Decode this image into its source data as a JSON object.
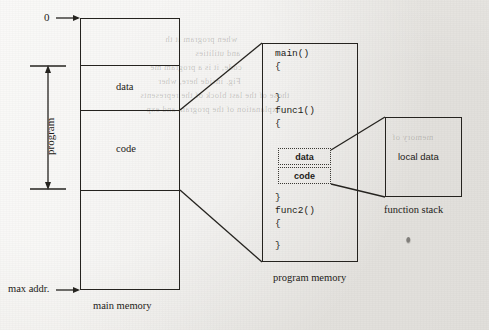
{
  "figure": {
    "background_color": "#efefec",
    "ink_color": "#25231f"
  },
  "main_memory": {
    "caption": "main memory",
    "top_label": "0",
    "bottom_label": "max addr.",
    "span_label": "program",
    "segments": [
      {
        "name": "",
        "label": ""
      },
      {
        "name": "data",
        "label": "data"
      },
      {
        "name": "code",
        "label": "code"
      },
      {
        "name": "",
        "label": ""
      }
    ]
  },
  "program_memory": {
    "caption": "program memory",
    "code_lines": [
      "main()",
      "{",
      "",
      "}",
      "func1()",
      "{",
      "",
      "",
      "}",
      "func2()",
      "{",
      "",
      "}"
    ],
    "inner_blocks": [
      {
        "label": "data"
      },
      {
        "label": "code"
      }
    ]
  },
  "function_stack": {
    "caption": "function stack",
    "label": "local data"
  },
  "page_bleed": [
    "when program it th",
    "and utilities",
    "code, it is a program me",
    "Fig. inside here, wher",
    "those of the last block of the represents",
    "explanation of the program and exp",
    "memory of"
  ]
}
